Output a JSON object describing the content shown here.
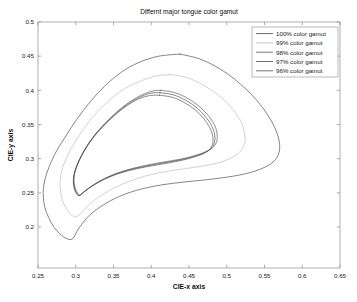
{
  "chart_data": {
    "type": "line",
    "title": "Differnt major tongue color gamut",
    "xlabel": "CIE-x axis",
    "ylabel": "CIE-y axis",
    "xlim": [
      0.25,
      0.65
    ],
    "ylim": [
      0.14,
      0.5
    ],
    "xticks": [
      "0.25",
      "0.3",
      "0.35",
      "0.4",
      "0.45",
      "0.5",
      "0.55",
      "0.6",
      "0.65"
    ],
    "xtick_values": [
      0.25,
      0.3,
      0.35,
      0.4,
      0.45,
      0.5,
      0.55,
      0.6,
      0.65
    ],
    "yticks": [
      "0.2",
      "0.25",
      "0.3",
      "0.35",
      "0.4",
      "0.45",
      "0.5"
    ],
    "ytick_values": [
      0.2,
      0.25,
      0.3,
      0.35,
      0.4,
      0.45,
      0.5
    ],
    "grid": false,
    "legend_position": "upper right",
    "series": [
      {
        "name": "100% color gamut",
        "color": "#3a3a3a",
        "closed": true,
        "points": [
          [
            0.438,
            0.453
          ],
          [
            0.464,
            0.446
          ],
          [
            0.49,
            0.432
          ],
          [
            0.514,
            0.413
          ],
          [
            0.536,
            0.39
          ],
          [
            0.553,
            0.366
          ],
          [
            0.565,
            0.342
          ],
          [
            0.57,
            0.321
          ],
          [
            0.568,
            0.305
          ],
          [
            0.559,
            0.293
          ],
          [
            0.543,
            0.284
          ],
          [
            0.521,
            0.277
          ],
          [
            0.494,
            0.272
          ],
          [
            0.463,
            0.268
          ],
          [
            0.429,
            0.264
          ],
          [
            0.396,
            0.258
          ],
          [
            0.365,
            0.248
          ],
          [
            0.339,
            0.234
          ],
          [
            0.318,
            0.217
          ],
          [
            0.304,
            0.198
          ],
          [
            0.296,
            0.183
          ],
          [
            0.288,
            0.183
          ],
          [
            0.279,
            0.19
          ],
          [
            0.271,
            0.2
          ],
          [
            0.264,
            0.214
          ],
          [
            0.259,
            0.229
          ],
          [
            0.257,
            0.245
          ],
          [
            0.258,
            0.263
          ],
          [
            0.263,
            0.283
          ],
          [
            0.272,
            0.306
          ],
          [
            0.285,
            0.33
          ],
          [
            0.301,
            0.357
          ],
          [
            0.319,
            0.383
          ],
          [
            0.339,
            0.407
          ],
          [
            0.361,
            0.427
          ],
          [
            0.384,
            0.441
          ],
          [
            0.41,
            0.45
          ],
          [
            0.438,
            0.453
          ]
        ]
      },
      {
        "name": "99% color gamut",
        "color": "#b5b5b5",
        "closed": true,
        "points": [
          [
            0.427,
            0.423
          ],
          [
            0.449,
            0.418
          ],
          [
            0.47,
            0.407
          ],
          [
            0.489,
            0.393
          ],
          [
            0.505,
            0.376
          ],
          [
            0.517,
            0.358
          ],
          [
            0.523,
            0.34
          ],
          [
            0.524,
            0.324
          ],
          [
            0.519,
            0.312
          ],
          [
            0.509,
            0.303
          ],
          [
            0.495,
            0.296
          ],
          [
            0.477,
            0.291
          ],
          [
            0.455,
            0.287
          ],
          [
            0.43,
            0.283
          ],
          [
            0.404,
            0.278
          ],
          [
            0.379,
            0.27
          ],
          [
            0.356,
            0.26
          ],
          [
            0.335,
            0.247
          ],
          [
            0.318,
            0.233
          ],
          [
            0.307,
            0.22
          ],
          [
            0.3,
            0.215
          ],
          [
            0.294,
            0.218
          ],
          [
            0.288,
            0.226
          ],
          [
            0.283,
            0.237
          ],
          [
            0.28,
            0.25
          ],
          [
            0.279,
            0.264
          ],
          [
            0.281,
            0.28
          ],
          [
            0.286,
            0.297
          ],
          [
            0.295,
            0.317
          ],
          [
            0.307,
            0.338
          ],
          [
            0.321,
            0.359
          ],
          [
            0.338,
            0.379
          ],
          [
            0.356,
            0.396
          ],
          [
            0.376,
            0.409
          ],
          [
            0.397,
            0.418
          ],
          [
            0.412,
            0.422
          ],
          [
            0.427,
            0.423
          ]
        ]
      },
      {
        "name": "98% color gamut",
        "color": "#4a4a4a",
        "closed": true,
        "points": [
          [
            0.412,
            0.4
          ],
          [
            0.43,
            0.397
          ],
          [
            0.447,
            0.389
          ],
          [
            0.462,
            0.378
          ],
          [
            0.474,
            0.365
          ],
          [
            0.483,
            0.351
          ],
          [
            0.487,
            0.338
          ],
          [
            0.487,
            0.327
          ],
          [
            0.483,
            0.318
          ],
          [
            0.474,
            0.311
          ],
          [
            0.462,
            0.306
          ],
          [
            0.446,
            0.301
          ],
          [
            0.427,
            0.297
          ],
          [
            0.406,
            0.293
          ],
          [
            0.384,
            0.288
          ],
          [
            0.363,
            0.282
          ],
          [
            0.344,
            0.274
          ],
          [
            0.327,
            0.264
          ],
          [
            0.314,
            0.254
          ],
          [
            0.306,
            0.247
          ],
          [
            0.303,
            0.249
          ],
          [
            0.3,
            0.255
          ],
          [
            0.298,
            0.264
          ],
          [
            0.298,
            0.275
          ],
          [
            0.301,
            0.288
          ],
          [
            0.307,
            0.303
          ],
          [
            0.315,
            0.319
          ],
          [
            0.326,
            0.336
          ],
          [
            0.339,
            0.352
          ],
          [
            0.354,
            0.368
          ],
          [
            0.37,
            0.382
          ],
          [
            0.387,
            0.393
          ],
          [
            0.402,
            0.399
          ],
          [
            0.412,
            0.4
          ]
        ]
      },
      {
        "name": "97% color gamut",
        "color": "#3f3f3f",
        "closed": true,
        "points": [
          [
            0.4115,
            0.3965
          ],
          [
            0.429,
            0.3935
          ],
          [
            0.4455,
            0.3855
          ],
          [
            0.46,
            0.3748
          ],
          [
            0.4715,
            0.362
          ],
          [
            0.48,
            0.3482
          ],
          [
            0.484,
            0.3355
          ],
          [
            0.484,
            0.3248
          ],
          [
            0.48,
            0.316
          ],
          [
            0.4712,
            0.3092
          ],
          [
            0.4592,
            0.3042
          ],
          [
            0.4434,
            0.2994
          ],
          [
            0.4246,
            0.2954
          ],
          [
            0.4038,
            0.2914
          ],
          [
            0.382,
            0.2866
          ],
          [
            0.3612,
            0.2806
          ],
          [
            0.3424,
            0.2728
          ],
          [
            0.3256,
            0.263
          ],
          [
            0.3128,
            0.2532
          ],
          [
            0.305,
            0.2464
          ],
          [
            0.302,
            0.2484
          ],
          [
            0.2992,
            0.2542
          ],
          [
            0.2974,
            0.263
          ],
          [
            0.2974,
            0.2738
          ],
          [
            0.3004,
            0.2866
          ],
          [
            0.3062,
            0.3014
          ],
          [
            0.3142,
            0.3172
          ],
          [
            0.325,
            0.334
          ],
          [
            0.3378,
            0.3498
          ],
          [
            0.3526,
            0.3656
          ],
          [
            0.3684,
            0.3794
          ],
          [
            0.3852,
            0.3902
          ],
          [
            0.4,
            0.396
          ],
          [
            0.4115,
            0.3965
          ]
        ]
      },
      {
        "name": "96% color gamut",
        "color": "#454545",
        "closed": true,
        "points": [
          [
            0.4108,
            0.3928
          ],
          [
            0.4278,
            0.3898
          ],
          [
            0.444,
            0.382
          ],
          [
            0.4582,
            0.3714
          ],
          [
            0.4694,
            0.3588
          ],
          [
            0.4776,
            0.3452
          ],
          [
            0.4814,
            0.3328
          ],
          [
            0.4814,
            0.3224
          ],
          [
            0.4774,
            0.3138
          ],
          [
            0.4688,
            0.3072
          ],
          [
            0.457,
            0.3024
          ],
          [
            0.4414,
            0.2978
          ],
          [
            0.4228,
            0.2938
          ],
          [
            0.4022,
            0.2898
          ],
          [
            0.3806,
            0.2852
          ],
          [
            0.36,
            0.2792
          ],
          [
            0.3414,
            0.2716
          ],
          [
            0.3248,
            0.262
          ],
          [
            0.3122,
            0.2524
          ],
          [
            0.3046,
            0.2458
          ],
          [
            0.3016,
            0.2478
          ],
          [
            0.2988,
            0.2534
          ],
          [
            0.297,
            0.262
          ],
          [
            0.297,
            0.2726
          ],
          [
            0.3,
            0.2852
          ],
          [
            0.3056,
            0.2998
          ],
          [
            0.3134,
            0.3154
          ],
          [
            0.324,
            0.332
          ],
          [
            0.3366,
            0.3476
          ],
          [
            0.3512,
            0.3632
          ],
          [
            0.3668,
            0.3768
          ],
          [
            0.3834,
            0.3874
          ],
          [
            0.3986,
            0.3924
          ],
          [
            0.4108,
            0.3928
          ]
        ]
      }
    ]
  },
  "legend": {
    "entries": [
      {
        "label": "100% color gamut"
      },
      {
        "label": "99% color gamut"
      },
      {
        "label": "98% color gamut"
      },
      {
        "label": "97% color gamut"
      },
      {
        "label": "96% color gamut"
      }
    ]
  }
}
